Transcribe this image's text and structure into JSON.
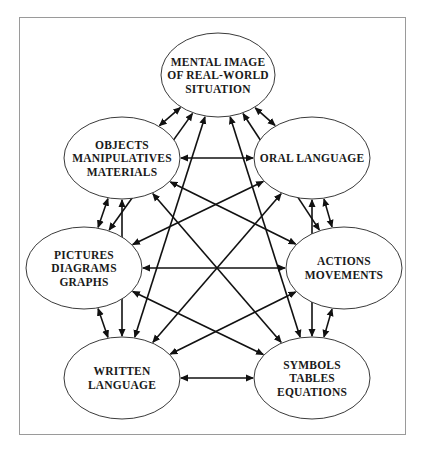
{
  "nodes": [
    {
      "id": "mental",
      "lines": [
        "MENTAL IMAGE",
        "OF REAL-WORLD",
        "SITUATION"
      ]
    },
    {
      "id": "objects",
      "lines": [
        "OBJECTS",
        "MANIPULATIVES",
        "MATERIALS"
      ]
    },
    {
      "id": "oral",
      "lines": [
        "ORAL LANGUAGE"
      ]
    },
    {
      "id": "pictures",
      "lines": [
        "PICTURES",
        "DIAGRAMS",
        "GRAPHS"
      ]
    },
    {
      "id": "actions",
      "lines": [
        "ACTIONS",
        "MOVEMENTS"
      ]
    },
    {
      "id": "written",
      "lines": [
        "WRITTEN",
        "LANGUAGE"
      ]
    },
    {
      "id": "symbols",
      "lines": [
        "SYMBOLS",
        "TABLES",
        "EQUATIONS"
      ]
    }
  ],
  "edges": [
    [
      "mental",
      "objects"
    ],
    [
      "mental",
      "oral"
    ],
    [
      "objects",
      "pictures"
    ],
    [
      "oral",
      "actions"
    ],
    [
      "pictures",
      "written"
    ],
    [
      "actions",
      "symbols"
    ],
    [
      "objects",
      "oral"
    ],
    [
      "pictures",
      "actions"
    ],
    [
      "written",
      "symbols"
    ],
    [
      "mental",
      "pictures"
    ],
    [
      "mental",
      "written"
    ],
    [
      "mental",
      "actions"
    ],
    [
      "mental",
      "symbols"
    ],
    [
      "objects",
      "actions"
    ],
    [
      "objects",
      "written"
    ],
    [
      "objects",
      "symbols"
    ],
    [
      "oral",
      "pictures"
    ],
    [
      "oral",
      "written"
    ],
    [
      "oral",
      "symbols"
    ],
    [
      "pictures",
      "symbols"
    ],
    [
      "written",
      "actions"
    ]
  ],
  "edge_style": "double-headed-arrow",
  "colors": {
    "line": "#111111",
    "frame": "#9a9a9a",
    "ellipse_stroke": "#3a3a3a"
  }
}
